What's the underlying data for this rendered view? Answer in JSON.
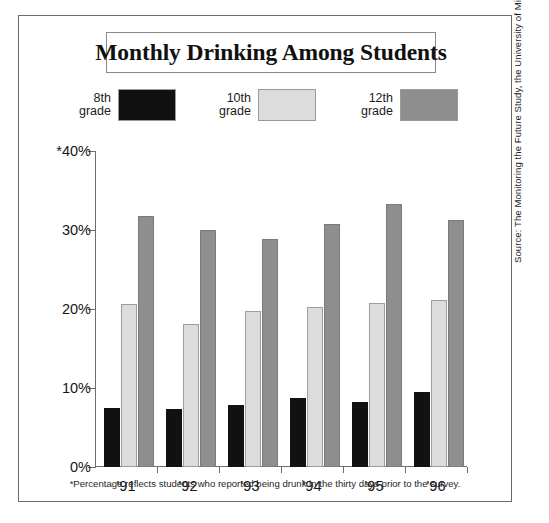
{
  "title": "Monthly Drinking Among Students",
  "footnote": "*Percentage reflects students who reported being drunk in the thirty days prior to the survey.",
  "source": "Source: The Monitoring the Future Study, the University of Michigan",
  "legend": [
    {
      "label": "8th\ngrade",
      "swatch_name": "legend-swatch-8th-grade",
      "color": "#111111"
    },
    {
      "label": "10th\ngrade",
      "swatch_name": "legend-swatch-10th-grade",
      "color": "#dcdcdc"
    },
    {
      "label": "12th\ngrade",
      "swatch_name": "legend-swatch-12th-grade",
      "color": "#8e8e8e"
    }
  ],
  "axis": {
    "y_ticks": [
      "0%",
      "10%",
      "20%",
      "30%",
      "*40%"
    ],
    "x_ticks": [
      "'91",
      "'92",
      "'93",
      "'94",
      "'95",
      "'96"
    ]
  },
  "chart_data": {
    "type": "bar",
    "title": "Monthly Drinking Among Students",
    "xlabel": "",
    "ylabel": "",
    "ylim": [
      0,
      40
    ],
    "yticks": [
      0,
      10,
      20,
      30,
      40
    ],
    "ytick_labels": [
      "0%",
      "10%",
      "20%",
      "30%",
      "*40%"
    ],
    "grid": false,
    "legend_position": "top",
    "categories": [
      "'91",
      "'92",
      "'93",
      "'94",
      "'95",
      "'96"
    ],
    "series": [
      {
        "name": "8th grade",
        "color": "#111111",
        "values": [
          7.5,
          7.4,
          7.8,
          8.7,
          8.2,
          9.5
        ]
      },
      {
        "name": "10th grade",
        "color": "#dcdcdc",
        "values": [
          20.6,
          18.1,
          19.7,
          20.3,
          20.8,
          21.2
        ]
      },
      {
        "name": "12th grade",
        "color": "#8e8e8e",
        "values": [
          31.8,
          30.0,
          28.9,
          30.7,
          33.3,
          31.3
        ]
      }
    ],
    "annotations": [
      "*Percentage reflects students who reported being drunk in the thirty days prior to the survey."
    ],
    "source": "Source: The Monitoring the Future Study, the University of Michigan"
  }
}
